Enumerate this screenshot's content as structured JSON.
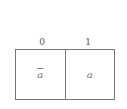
{
  "kmap": {
    "columns": [
      "0",
      "1"
    ],
    "cells": [
      {
        "label": "a",
        "negated": true
      },
      {
        "label": "a",
        "negated": false
      }
    ]
  }
}
